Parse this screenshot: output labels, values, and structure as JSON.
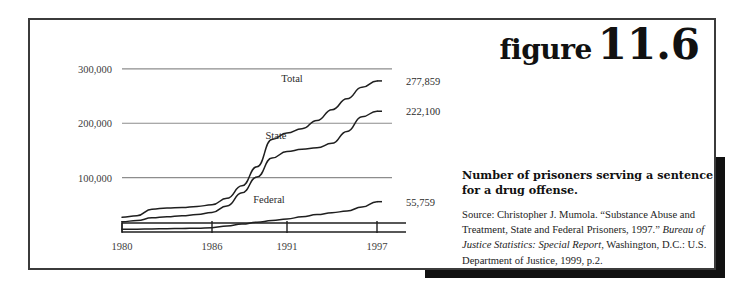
{
  "figure": {
    "word": "figure",
    "number": "11.6"
  },
  "caption": {
    "title": "Number of prisoners serving a sentence for a drug offense.",
    "source_prefix": "Source: Christopher J. Mumola. “Substance Abuse and Treatment, State and Federal Prisoners, 1997.” ",
    "source_italic_1": "Bureau of Justice Statistics: Special Report",
    "source_mid": ", Washington, D.C.: U.S. Department of Justice, 1999, p.2."
  },
  "chart_data": {
    "type": "line",
    "title": "Number of prisoners serving a sentence for a drug offense.",
    "xlabel": "",
    "ylabel": "",
    "xlim": [
      1980,
      1998
    ],
    "ylim": [
      0,
      320000
    ],
    "grid": "horizontal",
    "legend": "inline-labels",
    "ytick_labels": [
      "100,000",
      "200,000",
      "300,000"
    ],
    "ytick_values": [
      100000,
      200000,
      300000
    ],
    "xtick_labels": [
      "1980",
      "1986",
      "1991",
      "1997"
    ],
    "xtick_values": [
      1980,
      1986,
      1991,
      1997
    ],
    "series": [
      {
        "name": "Total",
        "label": "Total",
        "end_label": "277,859",
        "x": [
          1980,
          1981,
          1982,
          1983,
          1984,
          1985,
          1986,
          1987,
          1988,
          1989,
          1990,
          1991,
          1992,
          1993,
          1994,
          1995,
          1996,
          1997
        ],
        "values": [
          27000,
          30000,
          42000,
          44000,
          45000,
          47000,
          50000,
          62000,
          85000,
          120000,
          170000,
          182000,
          190000,
          205000,
          225000,
          245000,
          266000,
          277859
        ]
      },
      {
        "name": "State",
        "label": "State",
        "end_label": "222,100",
        "x": [
          1980,
          1981,
          1982,
          1983,
          1984,
          1985,
          1986,
          1987,
          1988,
          1989,
          1990,
          1991,
          1992,
          1993,
          1994,
          1995,
          1996,
          1997
        ],
        "values": [
          19000,
          21000,
          26000,
          28000,
          30000,
          32000,
          36000,
          48000,
          72000,
          101000,
          136000,
          148000,
          152000,
          155000,
          163000,
          185000,
          212000,
          222100
        ]
      },
      {
        "name": "Federal",
        "label": "Federal",
        "end_label": "55,759",
        "x": [
          1980,
          1981,
          1982,
          1983,
          1984,
          1985,
          1986,
          1987,
          1988,
          1989,
          1990,
          1991,
          1992,
          1993,
          1994,
          1995,
          1996,
          1997
        ],
        "values": [
          4900,
          5200,
          5600,
          6000,
          6500,
          7100,
          8000,
          11000,
          14500,
          18000,
          21000,
          24000,
          28000,
          32000,
          35500,
          38500,
          46000,
          55759
        ]
      }
    ]
  },
  "colors": {
    "line": "#1f1f1f",
    "grid": "#8d8d8d",
    "axis": "#1f1f1f",
    "frame": "#3b3b3b",
    "shadow": "#111111"
  }
}
